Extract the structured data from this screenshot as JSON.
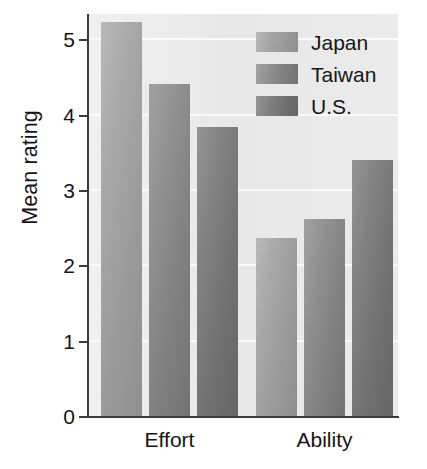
{
  "chart_data": {
    "type": "bar",
    "title": "",
    "xlabel": "",
    "ylabel": "Mean rating",
    "categories": [
      "Effort",
      "Ability"
    ],
    "series": [
      {
        "name": "Japan",
        "values": [
          5.24,
          2.37
        ],
        "color": "#a2a2a2"
      },
      {
        "name": "Taiwan",
        "values": [
          4.42,
          2.63
        ],
        "color": "#8a8a8a"
      },
      {
        "name": "U.S.",
        "values": [
          3.85,
          3.41
        ],
        "color": "#7a7a7a"
      }
    ],
    "ylim": [
      0,
      5.35
    ],
    "yticks": [
      "0",
      "1",
      "2",
      "3",
      "4",
      "5"
    ],
    "ytick_values": [
      0,
      1,
      2,
      3,
      4,
      5
    ],
    "grid": true,
    "gridlines_at": [
      1,
      2,
      3,
      4,
      5
    ],
    "legend_position": "top-right",
    "plot_background": "#ebebeb",
    "axis_color": "#3b3b3b",
    "text_color": "#141519"
  },
  "legend": {
    "entries": [
      {
        "label": "Japan",
        "swatch": "legend-swatch-japan"
      },
      {
        "label": "Taiwan",
        "swatch": "legend-swatch-taiwan"
      },
      {
        "label": "U.S.",
        "swatch": "legend-swatch-us"
      }
    ]
  },
  "axes": {
    "y_title": "Mean rating",
    "y_tick_labels": [
      "5",
      "4",
      "3",
      "2",
      "1",
      "0"
    ],
    "x_tick_labels": [
      "Effort",
      "Ability"
    ]
  }
}
